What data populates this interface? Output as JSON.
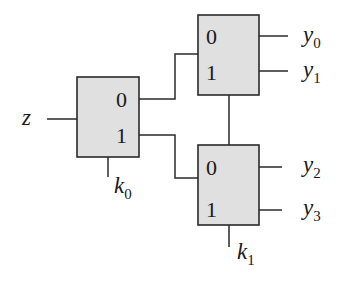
{
  "diagram": {
    "input": {
      "label": "z"
    },
    "switches": [
      {
        "id": "s0",
        "control": {
          "var": "k",
          "sub": "0"
        },
        "ports": [
          "0",
          "1"
        ]
      },
      {
        "id": "s1",
        "ports": [
          "0",
          "1"
        ]
      },
      {
        "id": "s2",
        "control": {
          "var": "k",
          "sub": "1"
        },
        "ports": [
          "0",
          "1"
        ]
      }
    ],
    "outputs": [
      {
        "var": "y",
        "sub": "0"
      },
      {
        "var": "y",
        "sub": "1"
      },
      {
        "var": "y",
        "sub": "2"
      },
      {
        "var": "y",
        "sub": "3"
      }
    ],
    "colors": {
      "box_fill": "#e0e0e0",
      "stroke": "#2a2a2a",
      "background": "#ffffff"
    }
  }
}
